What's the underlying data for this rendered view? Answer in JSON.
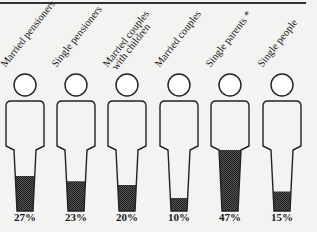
{
  "chart_data": {
    "type": "pictogram",
    "title": "",
    "categories": [
      "Married pensioners",
      "Single pensioners",
      "Married couples with children",
      "Married couples",
      "Single parents *",
      "Single people"
    ],
    "values": [
      27,
      23,
      20,
      10,
      47,
      15
    ],
    "value_labels": [
      "27%",
      "23%",
      "20%",
      "10%",
      "47%",
      "15%"
    ],
    "unit": "%",
    "xlabel": "",
    "ylabel": "",
    "ylim": [
      0,
      100
    ],
    "grid": false,
    "legend": null,
    "fill_pattern": "dark crosshatch",
    "colors": {
      "fill": "#3a3a3a",
      "outline": "#222222",
      "background": "#f3f3f1"
    }
  },
  "labels": {
    "c0": [
      "Married pensioners"
    ],
    "c1": [
      "Single pensioners"
    ],
    "c2": [
      "Married couples",
      "with children"
    ],
    "c3": [
      "Married couples"
    ],
    "c4": [
      "Single parents *"
    ],
    "c5": [
      "Single people"
    ]
  }
}
